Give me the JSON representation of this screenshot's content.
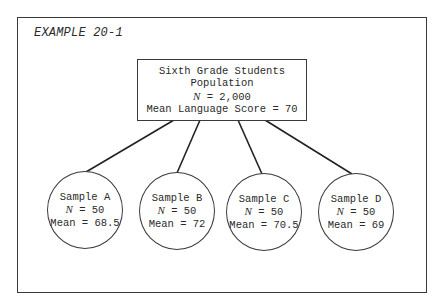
{
  "title": "EXAMPLE 20-1",
  "population": {
    "line1": "Sixth Grade Students",
    "line2": "Population",
    "n_symbol": "N",
    "n_value": " = 2,000",
    "mean_line": "Mean Language Score = 70"
  },
  "samples": [
    {
      "name": "Sample A",
      "n_symbol": "N",
      "n_value": " = 50",
      "mean": "Mean = 68.5"
    },
    {
      "name": "Sample B",
      "n_symbol": "N",
      "n_value": " = 50",
      "mean": "Mean = 72"
    },
    {
      "name": "Sample C",
      "n_symbol": "N",
      "n_value": " = 50",
      "mean": "Mean = 70.5"
    },
    {
      "name": "Sample D",
      "n_symbol": "N",
      "n_value": " = 50",
      "mean": "Mean = 69"
    }
  ],
  "colors": {
    "stroke": "#3a3a3a",
    "text": "#2a2a2a",
    "background": "#ffffff"
  }
}
